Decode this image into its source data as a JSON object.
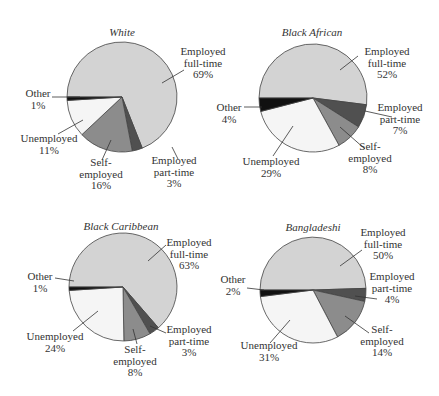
{
  "chart_data": [
    {
      "type": "pie",
      "title": "White",
      "categories": [
        "Employed full-time",
        "Employed part-time",
        "Self-employed",
        "Unemployed",
        "Other"
      ],
      "values": [
        69,
        3,
        16,
        11,
        1
      ],
      "labels": [
        "Employed\nfull-time\n69%",
        "Employed\npart-time\n3%",
        "Self-\nemployed\n16%",
        "Unemployed\n11%",
        "Other\n1%"
      ]
    },
    {
      "type": "pie",
      "title": "Black African",
      "categories": [
        "Employed full-time",
        "Employed part-time",
        "Self-employed",
        "Unemployed",
        "Other"
      ],
      "values": [
        52,
        7,
        8,
        29,
        4
      ],
      "labels": [
        "Employed\nfull-time\n52%",
        "Employed\npart-time\n7%",
        "Self-\nemployed\n8%",
        "Unemployed\n29%",
        "Other\n4%"
      ]
    },
    {
      "type": "pie",
      "title": "Black Caribbean",
      "categories": [
        "Employed full-time",
        "Employed part-time",
        "Self-employed",
        "Unemployed",
        "Other"
      ],
      "values": [
        63,
        3,
        8,
        24,
        1
      ],
      "labels": [
        "Employed\nfull-time\n63%",
        "Employed\npart-time\n3%",
        "Self-\nemployed\n8%",
        "Unemployed\n24%",
        "Other\n1%"
      ]
    },
    {
      "type": "pie",
      "title": "Bangladeshi",
      "categories": [
        "Employed full-time",
        "Employed part-time",
        "Self-employed",
        "Unemployed",
        "Other"
      ],
      "values": [
        50,
        4,
        14,
        31,
        2
      ],
      "labels": [
        "Employed\nfull-time\n50%",
        "Employed\npart-time\n4%",
        "Self-\nemployed\n14%",
        "Unemployed\n31%",
        "Other\n2%"
      ]
    }
  ],
  "colors": {
    "Employed full-time": "#d3d3d3",
    "Employed part-time": "#505050",
    "Self-employed": "#8c8c8c",
    "Unemployed": "#f5f5f5",
    "Other": "#111111",
    "outline": "#444444"
  }
}
